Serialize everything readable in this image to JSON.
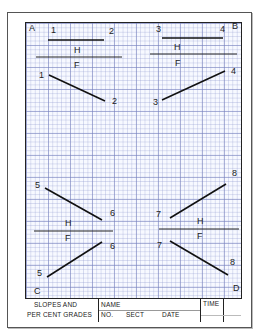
{
  "sheet": {
    "corners": {
      "a": "A",
      "b": "B",
      "c": "C",
      "d": "D"
    },
    "quadrants": {
      "top_left": {
        "p1": "1",
        "p2": "2",
        "h": "H",
        "f": "F",
        "p1_front": "1",
        "p2_front": "2"
      },
      "top_right": {
        "p1": "3",
        "p2": "4",
        "h": "H",
        "f": "F",
        "p1_front": "3",
        "p2_front": "4"
      },
      "bottom_left": {
        "p1": "5",
        "p2": "6",
        "h": "H",
        "f": "F",
        "p1_front": "5",
        "p2_front": "6"
      },
      "bottom_right": {
        "p1": "7",
        "p2": "8",
        "h": "H",
        "f": "F",
        "p1_front": "7",
        "p2_front": "8"
      }
    },
    "grid_color": "#8c96c8",
    "line_color": "#111111"
  },
  "title_block": {
    "title_line1": "SLOPES AND",
    "title_line2": "PER CENT GRADES",
    "name_label": "NAME",
    "no_label": "NO.",
    "sect_label": "SECT",
    "date_label": "DATE",
    "time_label": "TIME"
  }
}
